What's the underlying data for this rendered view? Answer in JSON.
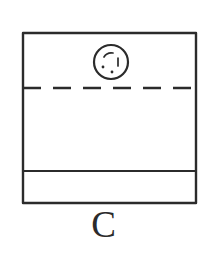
{
  "figure": {
    "caption": "C",
    "style": {
      "background_color": "#ffffff",
      "ink_color": "#2b2b2b",
      "stroke_width": 2.2
    },
    "outline": {
      "name": "outer-rectangle",
      "x": 23,
      "y": 33,
      "width": 173,
      "height": 170
    },
    "centerline": {
      "name": "horizontal-dashed-centerline",
      "y": 88,
      "x_start": 23,
      "x_end": 196,
      "dash": "18 12",
      "line_type": "dashed"
    },
    "divider": {
      "name": "horizontal-solid-divider",
      "y": 171,
      "x_start": 23,
      "x_end": 196,
      "line_type": "solid"
    },
    "bottom_band": {
      "name": "bottom-band",
      "y_top": 171,
      "y_bottom": 203,
      "height": 32
    },
    "circle": {
      "name": "circle-detail",
      "cx": 111,
      "cy": 62,
      "rx": 17,
      "ry": 17,
      "marks": [
        {
          "name": "arc-mark-top-left",
          "type": "arc"
        },
        {
          "name": "tick-mark-right",
          "type": "tick"
        },
        {
          "name": "dot-mark-lower-left",
          "type": "dot"
        },
        {
          "name": "dot-mark-bottom",
          "type": "dot"
        }
      ]
    }
  }
}
